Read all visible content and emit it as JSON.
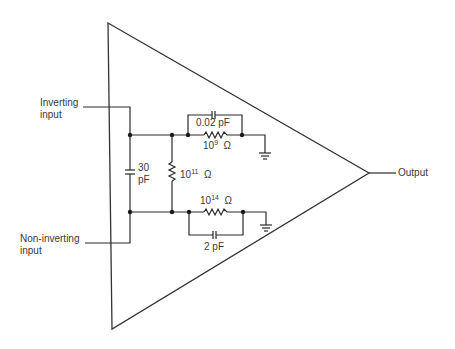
{
  "diagram": {
    "labels": {
      "inverting_line1": "Inverting",
      "inverting_line2": "input",
      "noninverting_line1": "Non-inverting",
      "noninverting_line2": "input",
      "output": "Output"
    },
    "components": {
      "c_top": "0.02 pF",
      "r_top_base": "10",
      "r_top_exp": "9",
      "r_top_unit": "Ω",
      "c_diff_line1": "30",
      "c_diff_line2": "pF",
      "r_diff_base": "10",
      "r_diff_exp": "11",
      "r_diff_unit": "Ω",
      "r_bot_base": "10",
      "r_bot_exp": "14",
      "r_bot_unit": "Ω",
      "c_bot": "2 pF"
    },
    "colors": {
      "line": "#2b2b2b",
      "text": "#3a3a3a",
      "background": "#ffffff"
    }
  }
}
